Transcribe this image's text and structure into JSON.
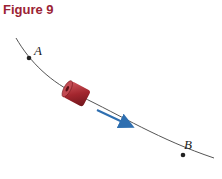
{
  "figure": {
    "title": "Figure 9",
    "title_color": "#9b2335",
    "points": [
      {
        "label": "A"
      },
      {
        "label": "B"
      }
    ],
    "colors": {
      "curve": "#555555",
      "bead": "#a3262e",
      "arrow": "#2f6fb0"
    },
    "elements": {
      "bead": "cylindrical-bead-icon",
      "arrow": "velocity-arrow-icon"
    }
  }
}
